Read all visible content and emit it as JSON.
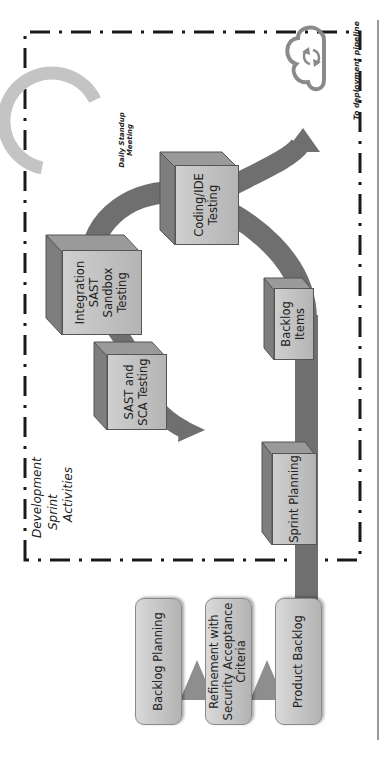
{
  "diagram": {
    "orientation": "rotated-90-ccw",
    "pipeline": {
      "boxes": [
        {
          "label": "Backlog Planning"
        },
        {
          "label": "Refinement with Security Acceptance Criteria"
        },
        {
          "label": "Product Backlog"
        }
      ]
    },
    "sprint_area": {
      "title_lines": [
        "Development",
        "Sprint",
        "Activities"
      ],
      "activities": [
        {
          "id": "sprint-planning",
          "label": "Sprint Planning"
        },
        {
          "id": "backlog-items",
          "label": "Backlog Items"
        },
        {
          "id": "coding-ide-testing",
          "label": "Coding/IDE Testing"
        },
        {
          "id": "integration-sast-sandbox-testing",
          "label": "Integration SAST Sandbox Testing"
        },
        {
          "id": "sast-sca-testing",
          "label": "SAST and SCA Testing"
        }
      ],
      "daily_standup": {
        "label_line1": "Daily Standup",
        "label_line2": "Meeting"
      }
    },
    "deployment": {
      "label": "To deployment pipeline",
      "icon": "cloud-sync-icon"
    },
    "colors": {
      "flow_arrow": "#6f6f6f",
      "standup_arc": "#c4c4c4",
      "box_fill": "#c4c4c4",
      "cube_top": "#7e7e7e",
      "dashed_border": "#1a1a1a"
    }
  }
}
